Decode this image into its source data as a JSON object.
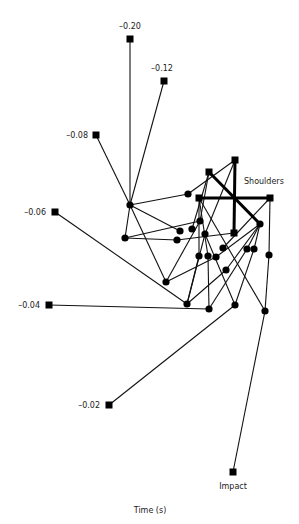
{
  "diagram": {
    "axis_label": "Time (s)",
    "colors": {
      "stroke": "#111111",
      "node": "#000000",
      "text": "#222222",
      "background": "#ffffff"
    },
    "time_markers": [
      {
        "id": "t020",
        "label": "-0.20",
        "x": 130,
        "y": 39,
        "lx": 130,
        "ly": 29,
        "anchor": "middle"
      },
      {
        "id": "t012",
        "label": "-0.12",
        "x": 164,
        "y": 81,
        "lx": 162,
        "ly": 71,
        "anchor": "middle"
      },
      {
        "id": "t008",
        "label": "-0.08",
        "x": 96,
        "y": 135,
        "lx": 88,
        "ly": 138,
        "anchor": "end"
      },
      {
        "id": "t006",
        "label": "-0.06",
        "x": 55,
        "y": 212,
        "lx": 46,
        "ly": 215,
        "anchor": "end"
      },
      {
        "id": "t004",
        "label": "-0.04",
        "x": 49,
        "y": 305,
        "lx": 40,
        "ly": 308,
        "anchor": "end"
      },
      {
        "id": "t002",
        "label": "-0.02",
        "x": 109,
        "y": 405,
        "lx": 100,
        "ly": 408,
        "anchor": "end"
      },
      {
        "id": "impact",
        "label": "Impact",
        "x": 233,
        "y": 472,
        "lx": 233,
        "ly": 489,
        "anchor": "middle"
      }
    ],
    "shoulders": {
      "label": "Shoulders",
      "lx": 244,
      "ly": 184,
      "squares": [
        {
          "x": 235,
          "y": 160
        },
        {
          "x": 209,
          "y": 172
        },
        {
          "x": 199,
          "y": 198
        },
        {
          "x": 270,
          "y": 198
        },
        {
          "x": 234,
          "y": 233
        }
      ],
      "thick_lines": [
        [
          235,
          160,
          234,
          233
        ],
        [
          199,
          198,
          270,
          198
        ],
        [
          209,
          172,
          260,
          224
        ]
      ]
    },
    "circles": [
      {
        "x": 130,
        "y": 205
      },
      {
        "x": 188,
        "y": 194
      },
      {
        "x": 125,
        "y": 238
      },
      {
        "x": 200,
        "y": 221
      },
      {
        "x": 180,
        "y": 231
      },
      {
        "x": 192,
        "y": 229
      },
      {
        "x": 177,
        "y": 240
      },
      {
        "x": 205,
        "y": 234
      },
      {
        "x": 260,
        "y": 224
      },
      {
        "x": 199,
        "y": 256
      },
      {
        "x": 208,
        "y": 256
      },
      {
        "x": 216,
        "y": 257
      },
      {
        "x": 223,
        "y": 248
      },
      {
        "x": 247,
        "y": 249
      },
      {
        "x": 254,
        "y": 249
      },
      {
        "x": 269,
        "y": 255
      },
      {
        "x": 226,
        "y": 270
      },
      {
        "x": 166,
        "y": 282
      },
      {
        "x": 187,
        "y": 304
      },
      {
        "x": 209,
        "y": 309
      },
      {
        "x": 235,
        "y": 305
      },
      {
        "x": 265,
        "y": 311
      }
    ],
    "lines": [
      [
        130,
        39,
        130,
        205
      ],
      [
        164,
        81,
        130,
        205
      ],
      [
        96,
        135,
        130,
        205
      ],
      [
        130,
        205,
        188,
        194
      ],
      [
        188,
        194,
        235,
        160
      ],
      [
        130,
        205,
        180,
        231
      ],
      [
        130,
        205,
        125,
        238
      ],
      [
        130,
        205,
        166,
        282
      ],
      [
        125,
        238,
        200,
        221
      ],
      [
        125,
        238,
        177,
        240
      ],
      [
        177,
        240,
        234,
        233
      ],
      [
        55,
        212,
        187,
        304
      ],
      [
        49,
        305,
        209,
        309
      ],
      [
        109,
        405,
        235,
        305
      ],
      [
        233,
        472,
        265,
        311
      ],
      [
        209,
        172,
        192,
        229
      ],
      [
        209,
        172,
        200,
        221
      ],
      [
        235,
        160,
        205,
        234
      ],
      [
        199,
        198,
        199,
        256
      ],
      [
        199,
        198,
        208,
        256
      ],
      [
        199,
        198,
        265,
        311
      ],
      [
        200,
        221,
        166,
        282
      ],
      [
        205,
        234,
        187,
        304
      ],
      [
        199,
        256,
        187,
        304
      ],
      [
        208,
        256,
        209,
        309
      ],
      [
        216,
        257,
        166,
        282
      ],
      [
        223,
        248,
        270,
        198
      ],
      [
        270,
        198,
        269,
        255
      ],
      [
        269,
        255,
        265,
        311
      ],
      [
        260,
        224,
        226,
        270
      ],
      [
        260,
        224,
        247,
        249
      ],
      [
        260,
        224,
        254,
        249
      ],
      [
        260,
        224,
        216,
        257
      ],
      [
        247,
        249,
        209,
        309
      ],
      [
        254,
        249,
        235,
        305
      ],
      [
        226,
        270,
        187,
        304
      ],
      [
        205,
        234,
        235,
        305
      ]
    ]
  }
}
